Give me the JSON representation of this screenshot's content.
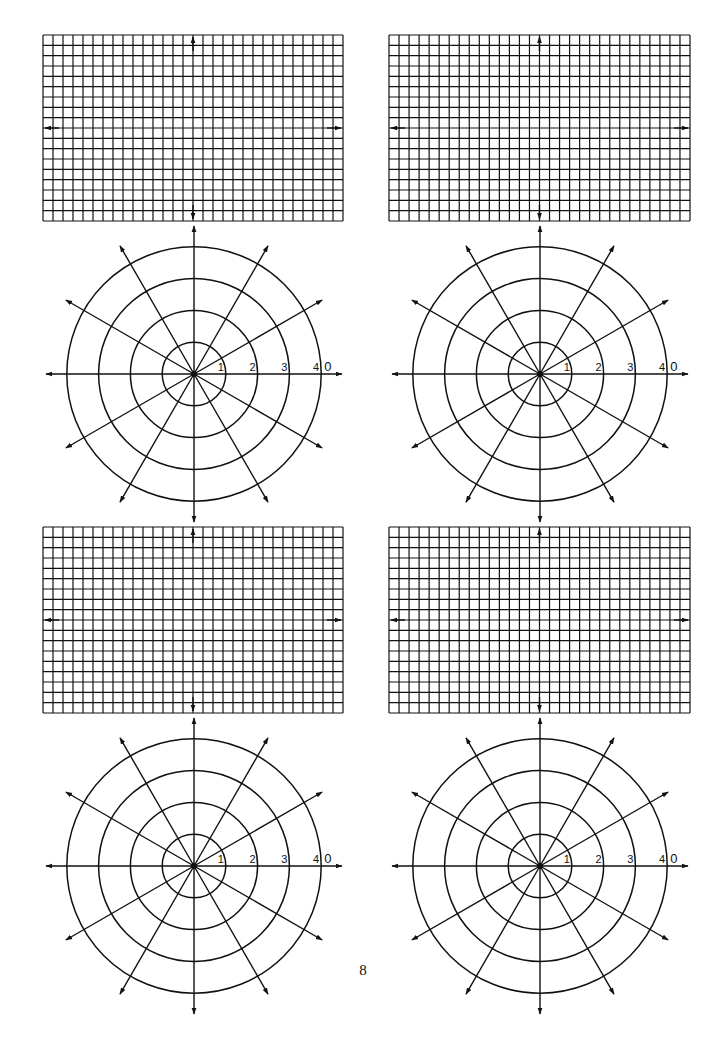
{
  "page": {
    "width": 722,
    "height": 1050,
    "page_number": "8",
    "page_number_pos": [
      363,
      962
    ],
    "line_color": "#111111",
    "background": "#ffffff"
  },
  "grids": [
    {
      "name": "grid-top-left",
      "x": 43,
      "y": 35,
      "cols": 30,
      "rows": 18,
      "width": 300,
      "height": 186
    },
    {
      "name": "grid-top-right",
      "x": 389,
      "y": 35,
      "cols": 30,
      "rows": 18,
      "width": 301,
      "height": 186
    },
    {
      "name": "grid-bottom-left",
      "x": 43,
      "y": 527,
      "cols": 30,
      "rows": 18,
      "width": 300,
      "height": 186
    },
    {
      "name": "grid-bottom-right",
      "x": 389,
      "y": 527,
      "cols": 30,
      "rows": 18,
      "width": 301,
      "height": 186
    }
  ],
  "polars": [
    {
      "name": "polar-top-left",
      "cx": 194,
      "cy": 374
    },
    {
      "name": "polar-top-right",
      "cx": 540,
      "cy": 374
    },
    {
      "name": "polar-bottom-left",
      "cx": 194,
      "cy": 866
    },
    {
      "name": "polar-bottom-right",
      "cx": 540,
      "cy": 866
    }
  ],
  "polar_spec": {
    "ring_spacing": 31.8,
    "ring_labels": [
      "1",
      "2",
      "3",
      "4"
    ],
    "zero_label": "0",
    "ray_angles_deg": [
      0,
      30,
      60,
      90,
      120,
      150,
      180,
      210,
      240,
      270,
      300,
      330
    ],
    "ray_length": 148
  }
}
